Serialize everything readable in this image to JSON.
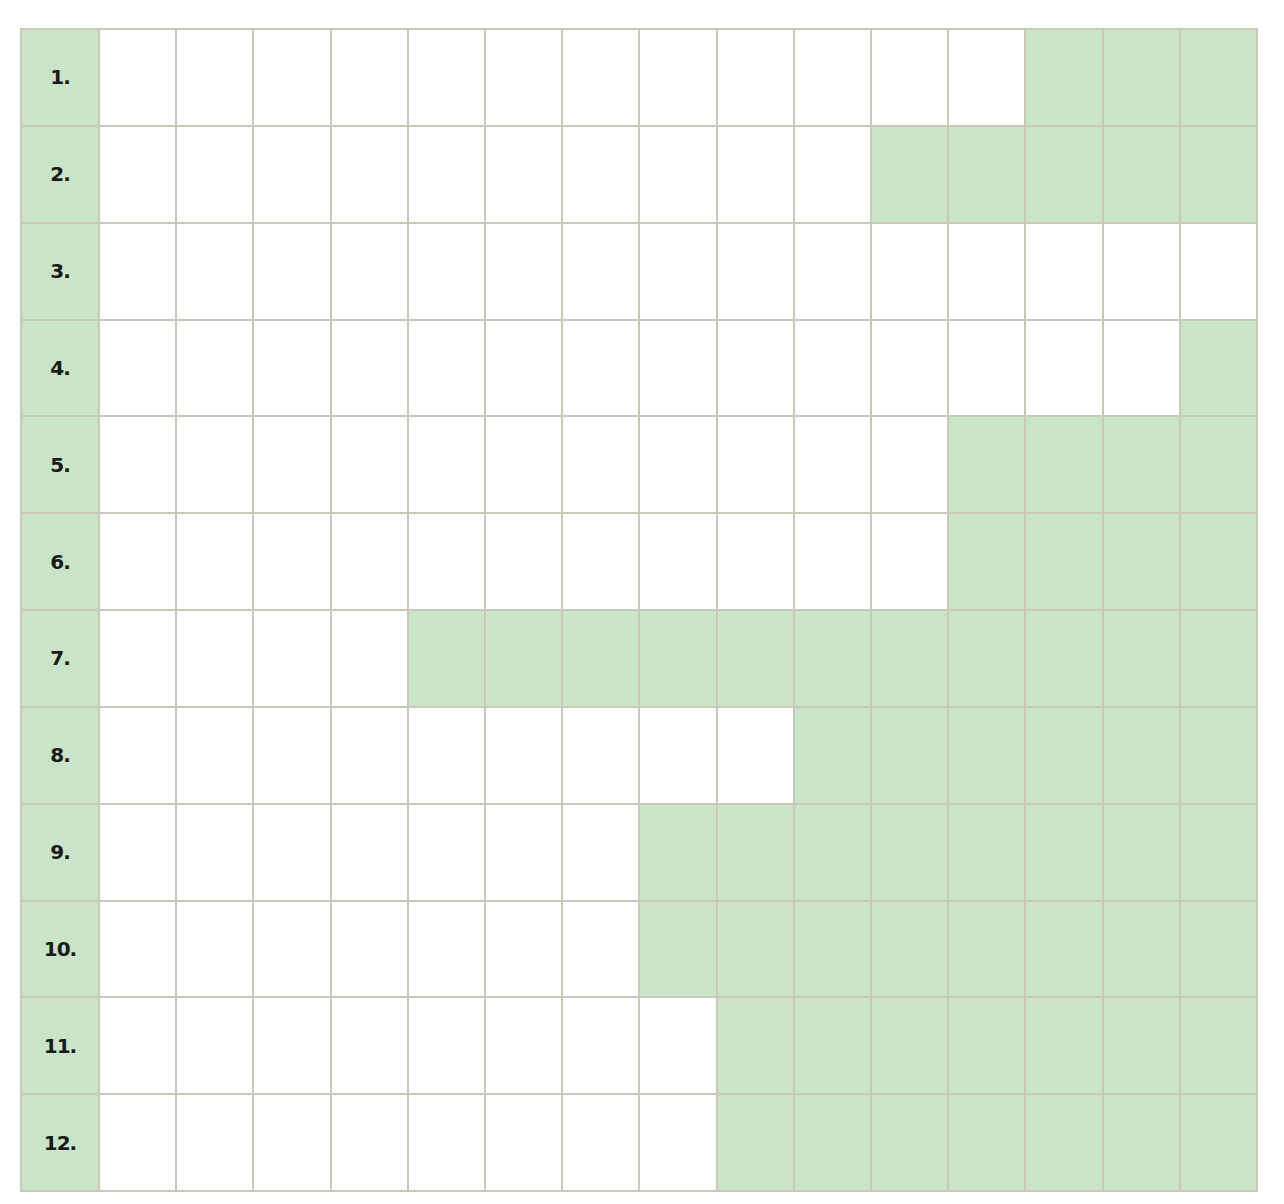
{
  "colors": {
    "fill": "#c9e4c8",
    "empty": "#ffffff",
    "line": "#c9c8b9"
  },
  "columns": 15,
  "rows": [
    {
      "label": "1.",
      "filled": [
        13,
        14,
        15
      ]
    },
    {
      "label": "2.",
      "filled": [
        11,
        12,
        13,
        14,
        15
      ]
    },
    {
      "label": "3.",
      "filled": []
    },
    {
      "label": "4.",
      "filled": [
        15
      ]
    },
    {
      "label": "5.",
      "filled": [
        12,
        13,
        14,
        15
      ]
    },
    {
      "label": "6.",
      "filled": [
        12,
        13,
        14,
        15
      ]
    },
    {
      "label": "7.",
      "filled": [
        5,
        6,
        7,
        8,
        9,
        10,
        11,
        12,
        13,
        14,
        15
      ]
    },
    {
      "label": "8.",
      "filled": [
        10,
        11,
        12,
        13,
        14,
        15
      ]
    },
    {
      "label": "9.",
      "filled": [
        8,
        9,
        10,
        11,
        12,
        13,
        14,
        15
      ]
    },
    {
      "label": "10.",
      "filled": [
        8,
        9,
        10,
        11,
        12,
        13,
        14,
        15
      ]
    },
    {
      "label": "11.",
      "filled": [
        9,
        10,
        11,
        12,
        13,
        14,
        15
      ]
    },
    {
      "label": "12.",
      "filled": [
        9,
        10,
        11,
        12,
        13,
        14,
        15
      ]
    }
  ]
}
